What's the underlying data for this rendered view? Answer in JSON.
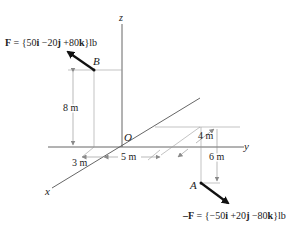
{
  "figure": {
    "axes": {
      "x_label": "x",
      "y_label": "y",
      "z_label": "z",
      "origin_label": "O"
    },
    "points": {
      "A": {
        "label": "A"
      },
      "B": {
        "label": "B"
      }
    },
    "forces": {
      "F_at_B": {
        "lhs": "F",
        "eq": " = {50",
        "i": "i",
        "mid1": " −20",
        "j": "j",
        "mid2": " +80",
        "k": "k",
        "unit": "}lb"
      },
      "negF_at_A": {
        "lhs": "–F",
        "eq": " = {−50",
        "i": "i",
        "mid1": " +20",
        "j": "j",
        "mid2": " −80",
        "k": "k",
        "unit": "}lb"
      }
    },
    "dimensions": {
      "height_B": "8 m",
      "offset_x_B": "3 m",
      "offset_y_B": "5 m",
      "offset_x_A": "4 m",
      "depth_A": "6 m"
    },
    "colors": {
      "axis": "#555555",
      "construction": "#9a9a9a",
      "force": "#111111",
      "text": "#222222"
    }
  }
}
